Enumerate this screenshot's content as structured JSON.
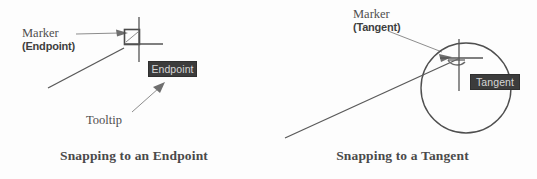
{
  "page": {
    "background_color": "#fdfdfd",
    "width": 537,
    "height": 179,
    "ink_color": "#4f4f4f",
    "tooltip_bg_color": "#3c3c3c",
    "tooltip_text_color": "#d6d6d6"
  },
  "figures": [
    {
      "id": "endpoint",
      "caption": "Snapping to an Endpoint",
      "callouts": [
        {
          "name": "marker",
          "main": "Marker",
          "sub": "(Endpoint)"
        },
        {
          "name": "tooltip",
          "main": "Tooltip",
          "sub": ""
        }
      ],
      "tooltip": {
        "label": "Endpoint"
      },
      "geometry": {
        "type": "line-endpoint-snap",
        "line_start": [
          47,
          81
        ],
        "line_end": [
          128,
          45
        ],
        "crosshair_center": [
          138,
          36
        ],
        "marker_box": [
          125,
          28,
          14,
          14
        ],
        "marker_kind": "square-endpoint-marker"
      }
    },
    {
      "id": "tangent",
      "caption": "Snapping to a Tangent",
      "callouts": [
        {
          "name": "marker",
          "main": "Marker",
          "sub": "(Tangent)"
        }
      ],
      "tooltip": {
        "label": "Tangent"
      },
      "geometry": {
        "type": "circle-tangent-snap",
        "circle_center": [
          466,
          88
        ],
        "circle_radius": 45,
        "line_start": [
          285,
          138
        ],
        "line_end": [
          456,
          59
        ],
        "crosshair_center": [
          459,
          58
        ],
        "marker_kind": "tangent-arc-marker"
      }
    }
  ]
}
